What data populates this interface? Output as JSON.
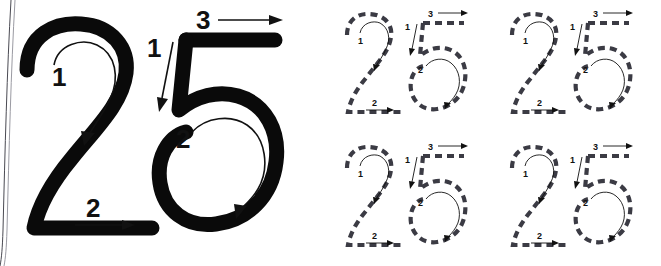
{
  "page": {
    "background_color": "#ffffff",
    "ink_color": "#0a0a0a",
    "dashed_ink_color": "#3b3b44",
    "width": 661,
    "height": 266
  },
  "demo": {
    "label": "large-demonstration-numerals",
    "digits": [
      {
        "glyph": "2",
        "steps": [
          {
            "number": "1",
            "arrow": "curved-clockwise",
            "description": "top curve from left around to down-left"
          },
          {
            "number": "2",
            "arrow": "straight-right",
            "description": "horizontal base stroke to the right"
          }
        ]
      },
      {
        "glyph": "5",
        "steps": [
          {
            "number": "1",
            "arrow": "straight-down",
            "description": "vertical stem downward"
          },
          {
            "number": "2",
            "arrow": "curved-clockwise",
            "description": "round bowl clockwise"
          },
          {
            "number": "3",
            "arrow": "straight-right",
            "description": "top horizontal bar to the right"
          }
        ]
      }
    ]
  },
  "practice": {
    "label": "dashed-tracing-grid",
    "rows": 2,
    "columns": 2,
    "cells": [
      {
        "position": "top-left",
        "digits": [
          {
            "glyph": "2",
            "steps": [
              {
                "number": "1"
              },
              {
                "number": "2"
              }
            ]
          },
          {
            "glyph": "5",
            "steps": [
              {
                "number": "1"
              },
              {
                "number": "2"
              },
              {
                "number": "3"
              }
            ]
          }
        ]
      },
      {
        "position": "top-right",
        "digits": [
          {
            "glyph": "2",
            "steps": [
              {
                "number": "1"
              },
              {
                "number": "2"
              }
            ]
          },
          {
            "glyph": "5",
            "steps": [
              {
                "number": "1"
              },
              {
                "number": "2"
              },
              {
                "number": "3"
              }
            ]
          }
        ]
      },
      {
        "position": "bottom-left",
        "digits": [
          {
            "glyph": "2",
            "steps": [
              {
                "number": "1"
              },
              {
                "number": "2"
              }
            ]
          },
          {
            "glyph": "5",
            "steps": [
              {
                "number": "1"
              },
              {
                "number": "2"
              },
              {
                "number": "3"
              }
            ]
          }
        ]
      },
      {
        "position": "bottom-right",
        "digits": [
          {
            "glyph": "2",
            "steps": [
              {
                "number": "1"
              },
              {
                "number": "2"
              }
            ]
          },
          {
            "glyph": "5",
            "steps": [
              {
                "number": "1"
              },
              {
                "number": "2"
              },
              {
                "number": "3"
              }
            ]
          }
        ]
      }
    ]
  },
  "labels": {
    "step1": "1",
    "step2": "2",
    "step3": "3"
  }
}
